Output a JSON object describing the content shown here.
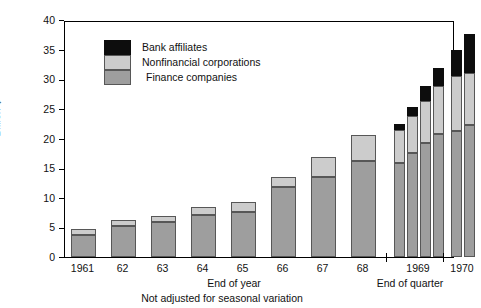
{
  "chart_data": {
    "type": "bar",
    "title": "",
    "xlabel": "End of year",
    "xlabel_right": "End of quarter",
    "ylabel": "Billion $",
    "note": "Not adjusted for seasonal variation",
    "ylim": [
      0,
      40
    ],
    "yticks": [
      0,
      5,
      10,
      15,
      20,
      25,
      30,
      35,
      40
    ],
    "grid": false,
    "legend_position": "upper-left-inside",
    "stacked": true,
    "categories": [
      "1961",
      "62",
      "63",
      "64",
      "65",
      "66",
      "67",
      "68",
      "1969 Q1",
      "1969 Q2",
      "1969 Q3",
      "1969 Q4",
      "1970 Q1",
      "1970 Q2"
    ],
    "tick_labels": [
      "1961",
      "62",
      "63",
      "64",
      "65",
      "66",
      "67",
      "68",
      "1969",
      "1970"
    ],
    "series": [
      {
        "name": "Finance companies",
        "color": "#9e9e9e",
        "values": [
          3.8,
          5.2,
          5.9,
          7.1,
          7.6,
          11.9,
          13.5,
          16.2,
          15.9,
          17.5,
          19.2,
          20.7,
          21.2,
          22.2
        ]
      },
      {
        "name": "Nonfinancial corporations",
        "color": "#cccccc",
        "values": [
          1.0,
          1.0,
          1.1,
          1.4,
          1.7,
          1.6,
          3.4,
          4.4,
          5.6,
          6.3,
          7.1,
          8.1,
          9.4,
          8.9
        ]
      },
      {
        "name": "Bank affiliates",
        "color": "#0d0d0d",
        "values": [
          0,
          0,
          0,
          0,
          0,
          0,
          0,
          0,
          0.9,
          1.6,
          2.6,
          3.1,
          4.4,
          6.6
        ]
      }
    ],
    "totals": [
      4.8,
      6.2,
      7.0,
      8.5,
      9.3,
      13.5,
      16.9,
      20.6,
      22.4,
      25.4,
      28.9,
      31.9,
      35.0,
      37.7
    ]
  },
  "legend": {
    "items": [
      {
        "label": "Bank affiliates",
        "swatch": "bank"
      },
      {
        "label": "Nonfinancial corporations",
        "swatch": "nonfin"
      },
      {
        "label": "Finance companies",
        "swatch": "finance"
      }
    ]
  },
  "axis": {
    "y_label": "Billion $",
    "y_ticks": [
      "40",
      "35",
      "30",
      "25",
      "20",
      "15",
      "10",
      "5",
      "0"
    ],
    "x_ticks": [
      "1961",
      "62",
      "63",
      "64",
      "65",
      "66",
      "67",
      "68",
      "1969",
      "1970"
    ],
    "caption_left": "End of year",
    "caption_right": "End of quarter",
    "caption_bottom": "Not adjusted for seasonal variation"
  }
}
